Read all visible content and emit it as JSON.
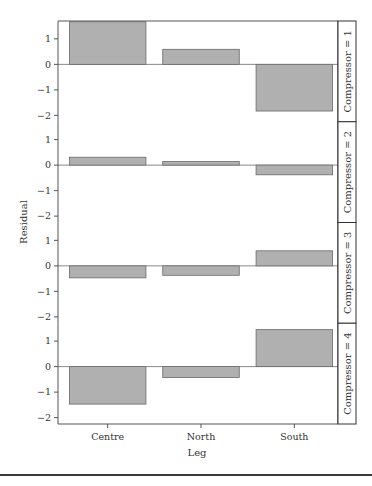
{
  "chart_data": {
    "type": "bar",
    "layout": "faceted-vertical",
    "xlabel": "Leg",
    "ylabel": "Residual",
    "categories": [
      "Centre",
      "North",
      "South"
    ],
    "ylim": [
      -2.25,
      1.7
    ],
    "yticks": [
      -2,
      -1,
      0,
      1
    ],
    "ytick_labels": [
      "−2",
      "−1",
      "0",
      "1"
    ],
    "grid": false,
    "panels": [
      {
        "strip_label": "Compressor = 1",
        "values": [
          1.67,
          0.59,
          -1.83
        ]
      },
      {
        "strip_label": "Compressor = 2",
        "values": [
          0.31,
          0.14,
          -0.38
        ]
      },
      {
        "strip_label": "Compressor = 3",
        "values": [
          -0.47,
          -0.37,
          0.59
        ]
      },
      {
        "strip_label": "Compressor = 4",
        "values": [
          -1.47,
          -0.43,
          1.45
        ]
      }
    ],
    "colors": {
      "bar_fill": "#b0b0b0",
      "bar_stroke": "#6a6a6a",
      "axis": "#555555",
      "zero_line": "#8a8a8a"
    }
  }
}
